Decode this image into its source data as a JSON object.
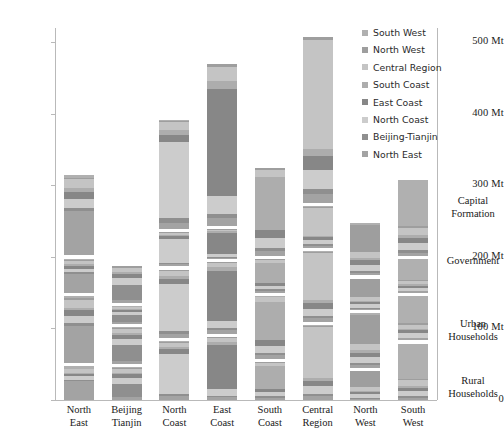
{
  "chart_data": {
    "type": "bar",
    "title": "",
    "xlabel": "",
    "ylabel": "",
    "ylim": [
      0,
      520
    ],
    "grid": false,
    "stacked": true,
    "legend_position": "top-right",
    "units": "Mt",
    "categories": [
      "North East",
      "Beijing Tianjin",
      "North Coast",
      "East Coast",
      "South Coast",
      "Central Region",
      "North West",
      "South West"
    ],
    "y_ticks": [
      {
        "value": 0,
        "label": "0"
      },
      {
        "value": 100,
        "label": "100 Mt"
      },
      {
        "value": 200,
        "label": "200 Mt"
      },
      {
        "value": 300,
        "label": "300 Mt"
      },
      {
        "value": 400,
        "label": "400 Mt"
      },
      {
        "value": 500,
        "label": "500 Mt"
      }
    ],
    "legend": [
      {
        "name": "South West",
        "color": "#b0b0b0"
      },
      {
        "name": "North West",
        "color": "#9e9e9e"
      },
      {
        "name": "Central Region",
        "color": "#c4c4c4"
      },
      {
        "name": "South Coast",
        "color": "#adadad"
      },
      {
        "name": "East Coast",
        "color": "#878787"
      },
      {
        "name": "North Coast",
        "color": "#cccccc"
      },
      {
        "name": "Beijing-Tianjin",
        "color": "#8f8f8f"
      },
      {
        "name": "North East",
        "color": "#a3a3a3"
      }
    ],
    "demand_blocks": [
      {
        "name": "Rural Households",
        "label_line1": "Rural",
        "label_line2": "Households"
      },
      {
        "name": "Urban Households",
        "label_line1": "Urban",
        "label_line2": "Households"
      },
      {
        "name": "Government",
        "label_line1": "Government",
        "label_line2": ""
      },
      {
        "name": "Capital Formation",
        "label_line1": "Capital",
        "label_line2": "Formation"
      }
    ],
    "block_totals": [
      {
        "category": "North East",
        "rural": 47,
        "urban": 94,
        "government": 48,
        "capital": 112,
        "total": 301
      },
      {
        "category": "Beijing Tianjin",
        "rural": 46,
        "urban": 52,
        "government": 25,
        "capital": 52,
        "total": 175
      },
      {
        "category": "North Coast",
        "rural": 82,
        "urban": 96,
        "government": 48,
        "capital": 152,
        "total": 378
      },
      {
        "category": "East Coast",
        "rural": 88,
        "urban": 100,
        "government": 42,
        "capital": 227,
        "total": 457
      },
      {
        "category": "South Coast",
        "rural": 53,
        "urban": 88,
        "government": 47,
        "capital": 124,
        "total": 312
      },
      {
        "category": "Central Region",
        "rural": 105,
        "urban": 99,
        "government": 58,
        "capital": 233,
        "total": 495
      },
      {
        "category": "North West",
        "rural": 41,
        "urban": 76,
        "government": 44,
        "capital": 73,
        "total": 234
      },
      {
        "category": "South West",
        "rural": 79,
        "urban": 62,
        "government": 47,
        "capital": 107,
        "total": 295
      }
    ],
    "series_order_bottom_to_top": [
      "North East",
      "Beijing-Tianjin",
      "North Coast",
      "East Coast",
      "South Coast",
      "Central Region",
      "North West",
      "South West"
    ],
    "bars": [
      {
        "category": "North East",
        "blocks": [
          {
            "block": "Rural Households",
            "values": [
              26,
              2,
              5,
              3,
              2,
              5,
              1,
              3
            ]
          },
          {
            "block": "Urban Households",
            "values": [
              52,
              4,
              10,
              8,
              4,
              11,
              2,
              3
            ]
          },
          {
            "block": "Government",
            "values": [
              27,
              2,
              5,
              4,
              2,
              5,
              1,
              2
            ]
          },
          {
            "block": "Capital Formation",
            "values": [
              62,
              5,
              12,
              10,
              5,
              13,
              2,
              3
            ]
          }
        ]
      },
      {
        "category": "Beijing Tianjin",
        "blocks": [
          {
            "block": "Rural Households",
            "values": [
              4,
              19,
              8,
              5,
              2,
              5,
              2,
              1
            ]
          },
          {
            "block": "Urban Households",
            "values": [
              4,
              22,
              9,
              6,
              3,
              5,
              2,
              1
            ]
          },
          {
            "block": "Government",
            "values": [
              2,
              10,
              4,
              3,
              1,
              3,
              1,
              1
            ]
          },
          {
            "block": "Capital Formation",
            "values": [
              4,
              21,
              9,
              6,
              3,
              6,
              2,
              1
            ]
          }
        ]
      },
      {
        "category": "North Coast",
        "blocks": [
          {
            "block": "Rural Households",
            "values": [
              5,
              3,
              57,
              6,
              3,
              6,
              1,
              1
            ]
          },
          {
            "block": "Urban Households",
            "values": [
              6,
              4,
              66,
              7,
              4,
              7,
              1,
              1
            ]
          },
          {
            "block": "Government",
            "values": [
              3,
              2,
              33,
              4,
              2,
              3,
              1,
              0
            ]
          },
          {
            "block": "Capital Formation",
            "values": [
              9,
              6,
              106,
              11,
              6,
              11,
              2,
              1
            ]
          }
        ]
      },
      {
        "category": "East Coast",
        "blocks": [
          {
            "block": "Rural Households",
            "values": [
              4,
              2,
              9,
              62,
              4,
              6,
              1,
              0
            ]
          },
          {
            "block": "Urban Households",
            "values": [
              5,
              3,
              10,
              70,
              5,
              6,
              1,
              0
            ]
          },
          {
            "block": "Government",
            "values": [
              2,
              1,
              4,
              30,
              2,
              2,
              1,
              0
            ]
          },
          {
            "block": "Capital Formation",
            "values": [
              11,
              6,
              25,
              150,
              11,
              20,
              3,
              1
            ]
          }
        ]
      },
      {
        "category": "South Coast",
        "blocks": [
          {
            "block": "Rural Households",
            "values": [
              3,
              2,
              6,
              5,
              32,
              4,
              1,
              0
            ]
          },
          {
            "block": "Urban Households",
            "values": [
              5,
              3,
              10,
              8,
              53,
              7,
              1,
              1
            ]
          },
          {
            "block": "Government",
            "values": [
              3,
              2,
              5,
              4,
              28,
              4,
              1,
              0
            ]
          },
          {
            "block": "Capital Formation",
            "values": [
              7,
              4,
              14,
              12,
              74,
              10,
              2,
              1
            ]
          }
        ]
      },
      {
        "category": "Central Region",
        "blocks": [
          {
            "block": "Rural Households",
            "values": [
              5,
              3,
              11,
              8,
              4,
              71,
              2,
              1
            ]
          },
          {
            "block": "Urban Households",
            "values": [
              5,
              3,
              10,
              8,
              4,
              66,
              2,
              1
            ]
          },
          {
            "block": "Government",
            "values": [
              3,
              2,
              6,
              4,
              2,
              39,
              1,
              1
            ]
          },
          {
            "block": "Capital Formation",
            "values": [
              13,
              7,
              26,
              20,
              10,
              152,
              4,
              1
            ]
          }
        ]
      },
      {
        "category": "North West",
        "blocks": [
          {
            "block": "Rural Households",
            "values": [
              2,
              1,
              5,
              3,
              2,
              5,
              22,
              1
            ]
          },
          {
            "block": "Urban Households",
            "values": [
              4,
              2,
              9,
              6,
              3,
              9,
              41,
              2
            ]
          },
          {
            "block": "Government",
            "values": [
              2,
              1,
              5,
              3,
              2,
              5,
              25,
              1
            ]
          },
          {
            "block": "Capital Formation",
            "values": [
              4,
              2,
              9,
              6,
              3,
              9,
              38,
              2
            ]
          }
        ]
      },
      {
        "category": "South West",
        "blocks": [
          {
            "block": "Rural Households",
            "values": [
              3,
              2,
              7,
              5,
              3,
              8,
              2,
              49
            ]
          },
          {
            "block": "Urban Households",
            "values": [
              3,
              1,
              6,
              4,
              2,
              6,
              2,
              38
            ]
          },
          {
            "block": "Government",
            "values": [
              2,
              1,
              4,
              3,
              2,
              5,
              1,
              29
            ]
          },
          {
            "block": "Capital Formation",
            "values": [
              5,
              3,
              10,
              7,
              4,
              11,
              2,
              65
            ]
          }
        ]
      }
    ]
  }
}
